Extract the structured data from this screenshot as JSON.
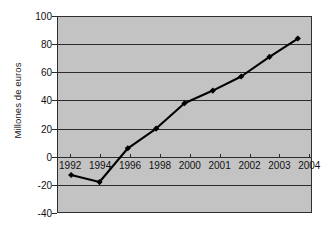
{
  "chart_data": {
    "type": "line",
    "title": "",
    "subtitle": "",
    "xlabel": "",
    "ylabel": "Millones de euros",
    "categories": [
      "1992",
      "1994",
      "1996",
      "1998",
      "2000",
      "2001",
      "2002",
      "2003",
      "2004"
    ],
    "values": [
      -13,
      -18,
      6,
      20,
      38,
      47,
      57,
      71,
      84
    ],
    "series": [
      {
        "name": "Millones de euros",
        "values": [
          -13,
          -18,
          6,
          20,
          38,
          47,
          57,
          71,
          84
        ]
      }
    ],
    "ylim": [
      -40,
      100
    ],
    "yticks": [
      100,
      80,
      60,
      40,
      20,
      0,
      -20,
      -40
    ],
    "ytick_labels": [
      "100",
      "80",
      "60",
      "40",
      "20",
      "0",
      "-20",
      "-40"
    ],
    "xticks": [
      "1992",
      "1994",
      "1996",
      "1998",
      "2000",
      "2001",
      "2002",
      "2003",
      "2004"
    ],
    "grid": "horizontal",
    "legend": "none",
    "marker": "diamond",
    "colors": {
      "plot_background": "#c3c3c3",
      "page_background": "#ffffff",
      "line": "#000000",
      "marker": "#000000",
      "gridline": "#2b2b2b",
      "axis": "#303030",
      "text": "#111111"
    }
  }
}
